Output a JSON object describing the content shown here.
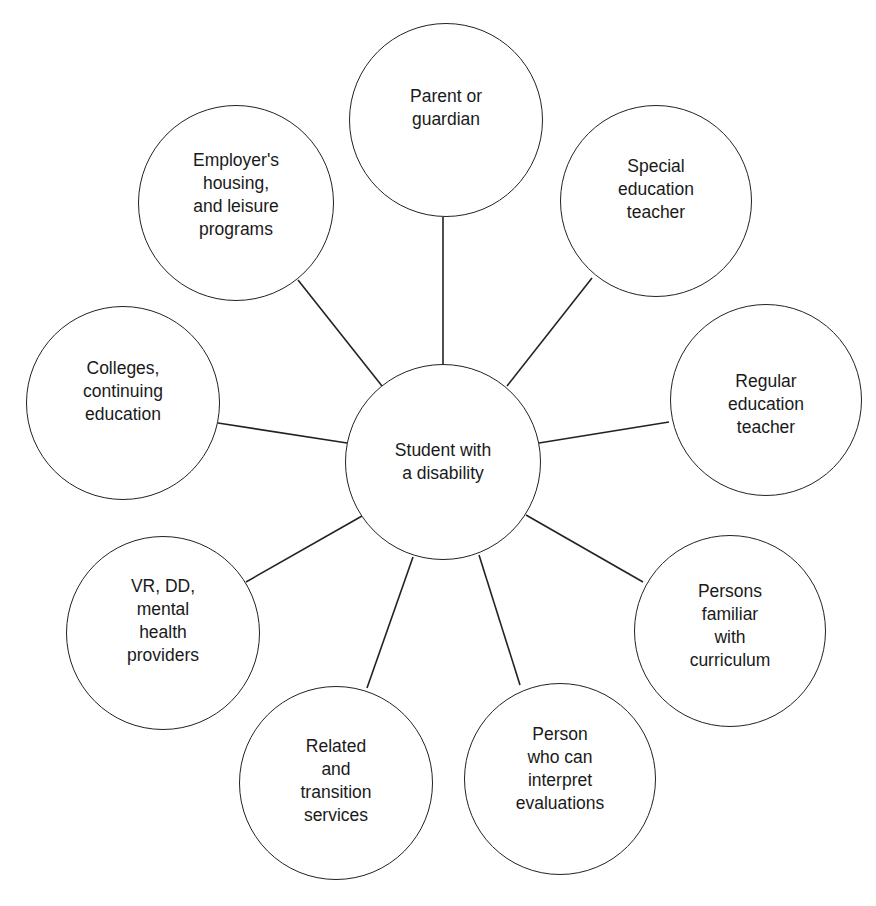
{
  "diagram": {
    "type": "hub-and-spoke",
    "center": {
      "label": "Student with\na disability",
      "cx": 443,
      "cy": 462,
      "r": 98,
      "text_offset_y": 0
    },
    "nodes": [
      {
        "id": "parent-or-guardian",
        "label": "Parent or\nguardian",
        "cx": 446,
        "cy": 120,
        "r": 97,
        "text_offset_y": -12,
        "line": [
          443,
          217,
          443,
          364
        ]
      },
      {
        "id": "special-education-teacher",
        "label": "Special\neducation\nteacher",
        "cx": 656,
        "cy": 201,
        "r": 96,
        "text_offset_y": -12,
        "line": [
          592,
          278,
          507,
          386
        ]
      },
      {
        "id": "regular-education-teacher",
        "label": "Regular\neducation\nteacher",
        "cx": 766,
        "cy": 400,
        "r": 96,
        "text_offset_y": 4,
        "line": [
          669,
          422,
          539,
          443
        ]
      },
      {
        "id": "persons-familiar-with-curriculum",
        "label": "Persons\nfamiliar\nwith\ncurriculum",
        "cx": 730,
        "cy": 631,
        "r": 96,
        "text_offset_y": -5,
        "line": [
          643,
          582,
          526,
          515
        ]
      },
      {
        "id": "person-who-can-interpret-evaluations",
        "label": "Person\nwho can\ninterpret\nevaluations",
        "cx": 560,
        "cy": 779,
        "r": 96,
        "text_offset_y": -10,
        "line": [
          520,
          685,
          479,
          555
        ]
      },
      {
        "id": "related-and-transition-services",
        "label": "Related\nand\ntransition\nservices",
        "cx": 336,
        "cy": 783,
        "r": 97,
        "text_offset_y": -2,
        "line": [
          367,
          688,
          413,
          557
        ]
      },
      {
        "id": "vr-dd-mental-health-providers",
        "label": "VR, DD,\nmental\nhealth\nproviders",
        "cx": 163,
        "cy": 633,
        "r": 97,
        "text_offset_y": -12,
        "line": [
          246,
          582,
          362,
          516
        ]
      },
      {
        "id": "colleges-continuing-education",
        "label": "Colleges,\ncontinuing\neducation",
        "cx": 123,
        "cy": 403,
        "r": 97,
        "text_offset_y": -12,
        "line": [
          218,
          423,
          347,
          443
        ]
      },
      {
        "id": "employers-housing-leisure-programs",
        "label": "Employer's\nhousing,\nand leisure\nprograms",
        "cx": 236,
        "cy": 203,
        "r": 98,
        "text_offset_y": -8,
        "line": [
          298,
          280,
          382,
          386
        ]
      }
    ]
  },
  "colors": {
    "stroke": "#222222",
    "text": "#1a1a1a",
    "background": "#ffffff"
  }
}
